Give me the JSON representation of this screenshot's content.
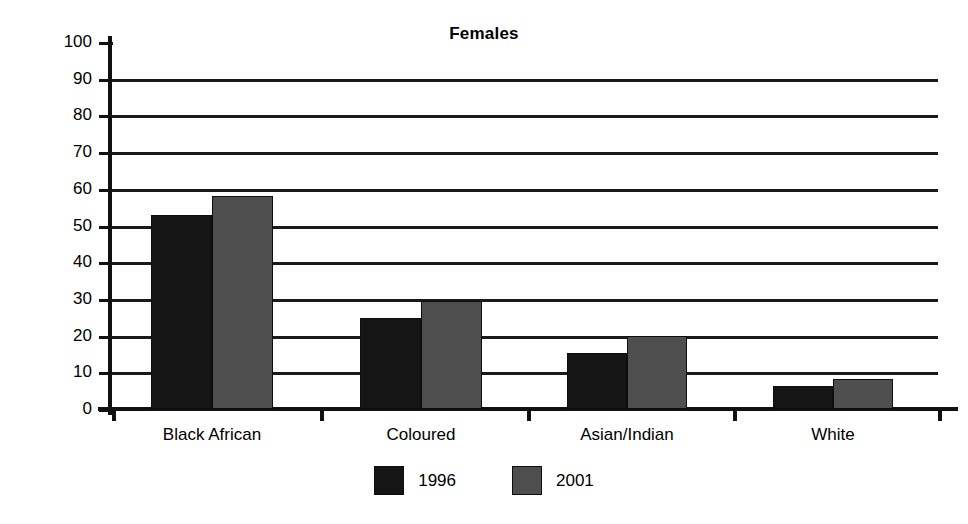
{
  "chart_data": {
    "type": "bar",
    "title": "Females",
    "xlabel": "",
    "ylabel": "% unemployed",
    "categories": [
      "Black African",
      "Coloured",
      "Asian/Indian",
      "White"
    ],
    "series": [
      {
        "name": "1996",
        "color": "#151515",
        "values": [
          53,
          24.7,
          15.3,
          6.3
        ]
      },
      {
        "name": "2001",
        "color": "#4e4e4e",
        "values": [
          58,
          29.5,
          20,
          8.2
        ]
      }
    ],
    "ylim": [
      0,
      100
    ],
    "ytick_labels": [
      "100",
      "90",
      "80",
      "70",
      "60",
      "50",
      "40",
      "30",
      "20",
      "10",
      "0"
    ],
    "ytick_values": [
      100,
      90,
      80,
      70,
      60,
      50,
      40,
      30,
      20,
      10,
      0
    ],
    "grid": "horizontal",
    "legend_position": "bottom-center"
  }
}
